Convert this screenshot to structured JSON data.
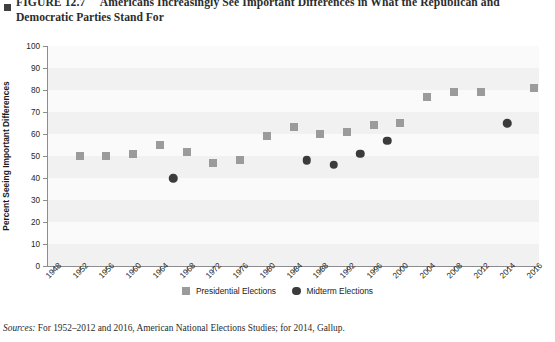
{
  "figure": {
    "label": "FIGURE 12.7",
    "title_line1": "Americans Increasingly See Important Differences in What the Republican and",
    "title_line2": "Democratic Parties Stand For",
    "title_full": "FIGURE 12.7 Americans Increasingly See Important Differences in What the Republican and Democratic Parties Stand For",
    "source_prefix": "Sources:",
    "source_text": " For 1952–2012 and 2016, American National Elections Studies; for 2014, Gallup."
  },
  "legend": {
    "position": "bottom-center",
    "items": [
      {
        "label": "Presidential Elections",
        "marker": "square",
        "color": "#9b9b9b"
      },
      {
        "label": "Midterm Elections",
        "marker": "circle",
        "color": "#3b3b3b"
      }
    ]
  },
  "colors": {
    "presidential": "#9b9b9b",
    "midterm": "#3b3b3b",
    "plot_background": "#fafafa",
    "band": "#f1f1f1",
    "axis": "#8d8d8d"
  },
  "chart_data": {
    "type": "scatter",
    "title": "Americans Increasingly See Important Differences in What the Republican and Democratic Parties Stand For",
    "xlabel": "",
    "ylabel": "Percent Seeing Important Differences",
    "ylim": [
      0,
      100
    ],
    "ytick_values": [
      0,
      10,
      20,
      30,
      40,
      50,
      60,
      70,
      80,
      90,
      100
    ],
    "xtick_labels": [
      "1948",
      "1952",
      "1956",
      "1960",
      "1964",
      "1968",
      "1972",
      "1976",
      "1980",
      "1984",
      "1988",
      "1992",
      "1996",
      "2000",
      "2004",
      "2008",
      "2012",
      "2014",
      "2016"
    ],
    "xlim": [
      1948,
      2016
    ],
    "grid": "horizontal-bands",
    "series": [
      {
        "name": "Presidential Elections",
        "marker": "square",
        "color": "#9b9b9b",
        "points": [
          {
            "x": 1952,
            "y": 50
          },
          {
            "x": 1956,
            "y": 50
          },
          {
            "x": 1960,
            "y": 51
          },
          {
            "x": 1964,
            "y": 55
          },
          {
            "x": 1968,
            "y": 52
          },
          {
            "x": 1972,
            "y": 47
          },
          {
            "x": 1976,
            "y": 48
          },
          {
            "x": 1980,
            "y": 59
          },
          {
            "x": 1984,
            "y": 63
          },
          {
            "x": 1988,
            "y": 60
          },
          {
            "x": 1992,
            "y": 61
          },
          {
            "x": 1996,
            "y": 64
          },
          {
            "x": 2000,
            "y": 65
          },
          {
            "x": 2004,
            "y": 77
          },
          {
            "x": 2008,
            "y": 79
          },
          {
            "x": 2012,
            "y": 79
          },
          {
            "x": 2016,
            "y": 81
          }
        ]
      },
      {
        "name": "Midterm Elections",
        "marker": "circle",
        "color": "#3b3b3b",
        "points": [
          {
            "x": 1966,
            "y": 40
          },
          {
            "x": 1986,
            "y": 48
          },
          {
            "x": 1990,
            "y": 46
          },
          {
            "x": 1994,
            "y": 51
          },
          {
            "x": 1998,
            "y": 57
          },
          {
            "x": 2014,
            "y": 65
          }
        ]
      }
    ]
  }
}
